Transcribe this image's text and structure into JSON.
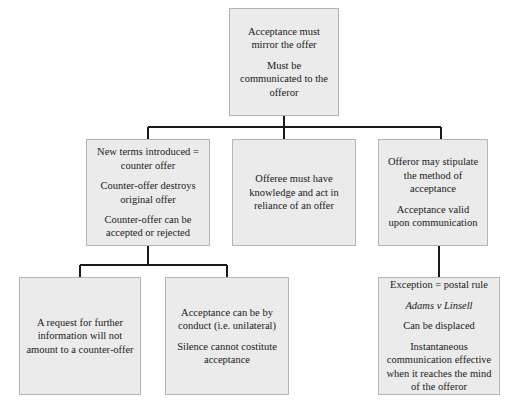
{
  "diagram": {
    "style": {
      "node_fill": "#ebebeb",
      "node_border": "#b4b4b4",
      "connector_color": "#1a1a1a",
      "background": "#ffffff",
      "text_color": "#1a1a1a"
    },
    "nodes": {
      "root": {
        "name": "acceptance-mirror-node",
        "paragraphs": [
          "Acceptance must mirror the offer",
          "Must be communicated to the offeror"
        ]
      },
      "counter": {
        "name": "counter-offer-node",
        "paragraphs": [
          "New terms introduced = counter offer",
          "Counter-offer destroys original offer",
          "Counter-offer can be accepted or rejected"
        ]
      },
      "knowledge": {
        "name": "offeree-knowledge-node",
        "paragraphs": [
          "Offeree must have knowledge and act in reliance of an offer"
        ]
      },
      "stipulate": {
        "name": "offeror-stipulate-node",
        "paragraphs": [
          "Offeror may stipulate the method of acceptance",
          "Acceptance valid upon communication"
        ]
      },
      "request": {
        "name": "request-information-node",
        "paragraphs": [
          "A request for further information will not amount to a counter-offer"
        ]
      },
      "conduct": {
        "name": "acceptance-by-conduct-node",
        "paragraphs": [
          "Acceptance can be by conduct (i.e. unilateral)",
          "Silence cannot costitute acceptance"
        ]
      },
      "postal": {
        "name": "postal-rule-node",
        "line_1": "Exception = postal rule",
        "case_citation": "Adams v Linsell",
        "line_3": "Can be displaced",
        "paragraph_4": "Instantaneous communication effective when it reaches the mind of the offeror"
      }
    },
    "edges": [
      {
        "from": "root",
        "to": "counter"
      },
      {
        "from": "root",
        "to": "knowledge"
      },
      {
        "from": "root",
        "to": "stipulate"
      },
      {
        "from": "counter",
        "to": "request"
      },
      {
        "from": "counter",
        "to": "conduct"
      },
      {
        "from": "stipulate",
        "to": "postal"
      }
    ]
  }
}
